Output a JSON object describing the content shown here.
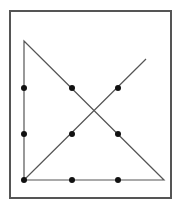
{
  "diagram": {
    "type": "nine-dot-puzzle-solution",
    "frame": {
      "x": 10,
      "y": 11,
      "width": 161,
      "height": 187,
      "stroke": "#555555"
    },
    "dots": [
      {
        "x": 24,
        "y": 88
      },
      {
        "x": 72,
        "y": 88
      },
      {
        "x": 118,
        "y": 88
      },
      {
        "x": 24,
        "y": 134
      },
      {
        "x": 72,
        "y": 134
      },
      {
        "x": 118,
        "y": 134
      },
      {
        "x": 24,
        "y": 180
      },
      {
        "x": 72,
        "y": 180
      },
      {
        "x": 118,
        "y": 180
      }
    ],
    "path": [
      {
        "x": 146,
        "y": 59
      },
      {
        "x": 24,
        "y": 180
      },
      {
        "x": 24,
        "y": 41
      },
      {
        "x": 164,
        "y": 180
      },
      {
        "x": 24,
        "y": 180
      }
    ],
    "line_color": "#555555",
    "dot_color": "#111111"
  }
}
